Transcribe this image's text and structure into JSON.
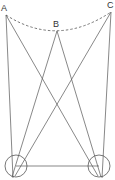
{
  "diagram": {
    "labels": {
      "a": "A",
      "b": "B",
      "c": "C"
    },
    "colors": {
      "line": "#555555",
      "text": "#333333",
      "background": "#ffffff"
    }
  }
}
